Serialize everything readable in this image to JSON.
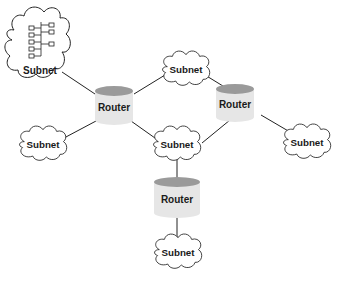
{
  "diagram": {
    "type": "network-topology",
    "colors": {
      "line": "#222222",
      "router_body": "#e6e6e6",
      "router_top": "#9a9a9a",
      "cloud_fill": "#ffffff",
      "cloud_stroke": "#222222"
    },
    "nodes": [
      {
        "id": "subnet-topleft",
        "kind": "subnet",
        "label": "Subnet",
        "has_hierarchy_icon": true
      },
      {
        "id": "router-left",
        "kind": "router",
        "label": "Router"
      },
      {
        "id": "subnet-topmid",
        "kind": "subnet",
        "label": "Subnet"
      },
      {
        "id": "router-right",
        "kind": "router",
        "label": "Router"
      },
      {
        "id": "subnet-left",
        "kind": "subnet",
        "label": "Subnet"
      },
      {
        "id": "subnet-center",
        "kind": "subnet",
        "label": "Subnet"
      },
      {
        "id": "subnet-right",
        "kind": "subnet",
        "label": "Subnet"
      },
      {
        "id": "router-bottom",
        "kind": "router",
        "label": "Router"
      },
      {
        "id": "subnet-bottom",
        "kind": "subnet",
        "label": "Subnet"
      }
    ],
    "edges": [
      [
        "subnet-topleft",
        "router-left"
      ],
      [
        "router-left",
        "subnet-topmid"
      ],
      [
        "subnet-topmid",
        "router-right"
      ],
      [
        "router-left",
        "subnet-left"
      ],
      [
        "router-left",
        "subnet-center"
      ],
      [
        "subnet-center",
        "router-right"
      ],
      [
        "router-right",
        "subnet-right"
      ],
      [
        "subnet-center",
        "router-bottom"
      ],
      [
        "router-bottom",
        "subnet-bottom"
      ]
    ]
  }
}
